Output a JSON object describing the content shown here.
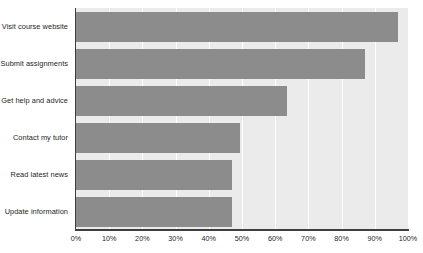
{
  "chart_data": {
    "type": "bar",
    "orientation": "horizontal",
    "title": "",
    "xlabel": "",
    "ylabel": "",
    "categories": [
      "Visit course website",
      "Submit assignments",
      "Get help and advice",
      "Contact my tutor",
      "Read latest news",
      "Update information"
    ],
    "values": [
      97,
      87,
      63.5,
      49.5,
      47,
      47
    ],
    "value_suffix": "%",
    "xlim": [
      0,
      100
    ],
    "xticks": [
      0,
      10,
      20,
      30,
      40,
      50,
      60,
      70,
      80,
      90,
      100
    ],
    "xtick_labels": [
      "0%",
      "10%",
      "20%",
      "30%",
      "40%",
      "50%",
      "60%",
      "70%",
      "80%",
      "90%",
      "100%"
    ],
    "grid": true,
    "grid_axis": "x",
    "legend": false,
    "series": [
      {
        "name": "",
        "values": [
          97,
          87,
          63.5,
          49.5,
          47,
          47
        ]
      }
    ],
    "colors": {
      "bar": "#8c8c8c",
      "plot_background": "#ebebeb",
      "gridline": "#ffffff",
      "axis_line": "#3f3f3f",
      "text": "#231f20",
      "page_background": "#ffffff"
    }
  }
}
